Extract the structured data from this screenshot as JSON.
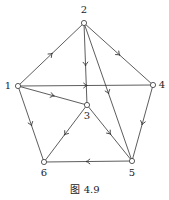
{
  "figure": {
    "caption": "图 4.9",
    "colors": {
      "line": "#333333",
      "node_fill": "#ffffff",
      "text": "#222222"
    }
  },
  "nodes": [
    {
      "id": "1",
      "label": "1",
      "x": 18,
      "y": 86,
      "lx": 8,
      "ly": 89
    },
    {
      "id": "2",
      "label": "2",
      "x": 84,
      "y": 23,
      "lx": 84,
      "ly": 13
    },
    {
      "id": "3",
      "label": "3",
      "x": 87,
      "y": 105,
      "lx": 87,
      "ly": 119
    },
    {
      "id": "4",
      "label": "4",
      "x": 153,
      "y": 85,
      "lx": 162,
      "ly": 88
    },
    {
      "id": "5",
      "label": "5",
      "x": 132,
      "y": 161,
      "lx": 132,
      "ly": 176
    },
    {
      "id": "6",
      "label": "6",
      "x": 44,
      "y": 162,
      "lx": 44,
      "ly": 176
    }
  ],
  "edges": [
    {
      "from": "1",
      "to": "2"
    },
    {
      "from": "2",
      "to": "4"
    },
    {
      "from": "2",
      "to": "3"
    },
    {
      "from": "2",
      "to": "5"
    },
    {
      "from": "1",
      "to": "4"
    },
    {
      "from": "1",
      "to": "3"
    },
    {
      "from": "1",
      "to": "6"
    },
    {
      "from": "3",
      "to": "6"
    },
    {
      "from": "3",
      "to": "5"
    },
    {
      "from": "4",
      "to": "5"
    },
    {
      "from": "5",
      "to": "6"
    }
  ]
}
